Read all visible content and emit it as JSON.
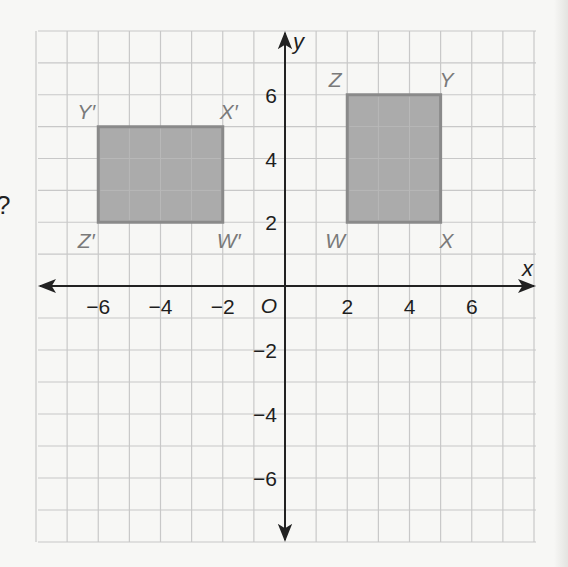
{
  "figure": {
    "type": "coordinate-plane",
    "grid": {
      "x_min": -8,
      "x_max": 8,
      "y_min": -8,
      "y_max": 8,
      "step": 1,
      "grid_color": "#c8c8c8",
      "axis_color": "#222222"
    },
    "axes": {
      "x_label": "x",
      "y_label": "y",
      "origin_label": "O",
      "x_ticks": [
        {
          "value": -6,
          "label": "−6"
        },
        {
          "value": -4,
          "label": "−4"
        },
        {
          "value": -2,
          "label": "−2"
        },
        {
          "value": 2,
          "label": "2"
        },
        {
          "value": 4,
          "label": "4"
        },
        {
          "value": 6,
          "label": "6"
        }
      ],
      "y_ticks": [
        {
          "value": 6,
          "label": "6"
        },
        {
          "value": 4,
          "label": "4"
        },
        {
          "value": 2,
          "label": "2"
        },
        {
          "value": -2,
          "label": "−2"
        },
        {
          "value": -4,
          "label": "−4"
        },
        {
          "value": -6,
          "label": "−6"
        }
      ]
    },
    "shapes": [
      {
        "name": "WXYZ",
        "fill": "#a6a6a6",
        "stroke": "#8a8a8a",
        "vertices": [
          {
            "label": "W",
            "x": 2,
            "y": 2,
            "label_pos": "below-left"
          },
          {
            "label": "X",
            "x": 5,
            "y": 2,
            "label_pos": "below-right"
          },
          {
            "label": "Y",
            "x": 5,
            "y": 6,
            "label_pos": "above-right"
          },
          {
            "label": "Z",
            "x": 2,
            "y": 6,
            "label_pos": "above-left"
          }
        ]
      },
      {
        "name": "W'X'Y'Z'",
        "fill": "#a6a6a6",
        "stroke": "#8a8a8a",
        "vertices": [
          {
            "label": "W′",
            "x": -2,
            "y": 2,
            "label_pos": "below-right"
          },
          {
            "label": "X′",
            "x": -2,
            "y": 5,
            "label_pos": "above-right"
          },
          {
            "label": "Y′",
            "x": -6,
            "y": 5,
            "label_pos": "above-left"
          },
          {
            "label": "Z′",
            "x": -6,
            "y": 2,
            "label_pos": "below-left"
          }
        ]
      }
    ],
    "vertex_label_color": "#7a7a7a",
    "tick_label_color": "#1e1e1e",
    "margin_text": "?"
  }
}
